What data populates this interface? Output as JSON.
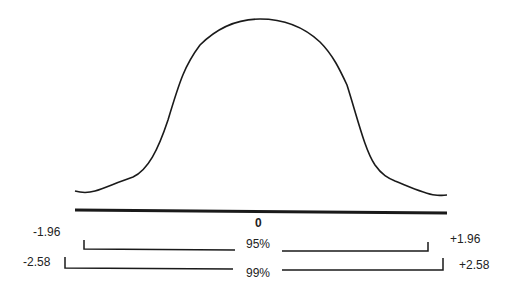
{
  "diagram": {
    "title": "",
    "type": "normal-distribution-confidence-intervals",
    "center_label": "0",
    "intervals": [
      {
        "level_label": "95%",
        "lower_label": "-1.96",
        "upper_label": "+1.96"
      },
      {
        "level_label": "99%",
        "lower_label": "-2.58",
        "upper_label": "+2.58"
      }
    ],
    "colors": {
      "stroke": "#1a1a1a",
      "background": "#ffffff"
    }
  }
}
